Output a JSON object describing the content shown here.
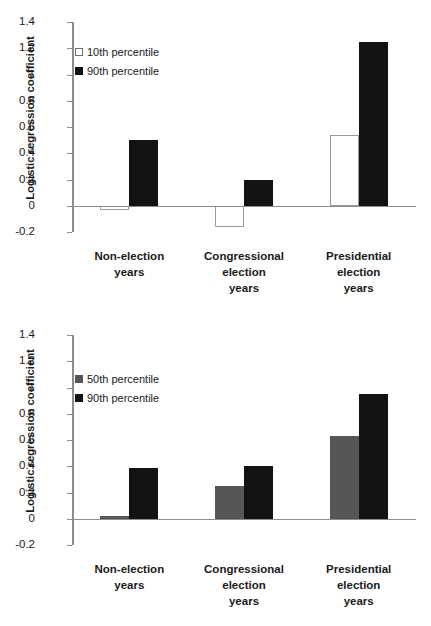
{
  "chart_data": [
    {
      "type": "bar",
      "panel": "top",
      "title": "",
      "xlabel": "",
      "ylabel": "Logistic regression coefficient",
      "ylim": [
        -0.2,
        1.4
      ],
      "yticks": [
        "1.4",
        "1.2",
        "1",
        "0.8",
        "0.6",
        "0.4",
        "0.2",
        "0",
        "-0.2"
      ],
      "ytick_values": [
        1.4,
        1.2,
        1.0,
        0.8,
        0.6,
        0.4,
        0.2,
        0.0,
        -0.2
      ],
      "grid": false,
      "legend_position": "upper left",
      "categories": [
        "Non-election\nyears",
        "Congressional\nelection\nyears",
        "Presidential\nelection\nyears"
      ],
      "series": [
        {
          "name": "10th percentile",
          "color": "#ffffff",
          "values": [
            -0.03,
            -0.165,
            0.54
          ]
        },
        {
          "name": "90th percentile",
          "color": "#121212",
          "values": [
            0.5,
            0.2,
            1.25
          ]
        }
      ]
    },
    {
      "type": "bar",
      "panel": "bottom",
      "title": "",
      "xlabel": "",
      "ylabel": "Logistic regression coefficient",
      "ylim": [
        -0.2,
        1.4
      ],
      "yticks": [
        "1.4",
        "1.2",
        "1",
        "0.8",
        "0.6",
        "0.4",
        "0.2",
        "0",
        "-0.2"
      ],
      "ytick_values": [
        1.4,
        1.2,
        1.0,
        0.8,
        0.6,
        0.4,
        0.2,
        0.0,
        -0.2
      ],
      "grid": false,
      "legend_position": "upper left",
      "categories": [
        "Non-election\nyears",
        "Congressional\nelection\nyears",
        "Presidential\nelection\nyears"
      ],
      "series": [
        {
          "name": "50th percentile",
          "color": "#565656",
          "values": [
            0.02,
            0.25,
            0.63
          ]
        },
        {
          "name": "90th percentile",
          "color": "#121212",
          "values": [
            0.39,
            0.4,
            0.95
          ]
        }
      ]
    }
  ],
  "panels": {
    "top": {
      "ylabel": "Logistic regression coefficient",
      "yticks": [
        "1.4",
        "1.2",
        "1",
        "0.8",
        "0.6",
        "0.4",
        "0.2",
        "0",
        "-0.2"
      ],
      "legend": [
        {
          "label": "10th percentile",
          "swatch": "white"
        },
        {
          "label": "90th percentile",
          "swatch": "black"
        }
      ],
      "categories": [
        "Non-election\nyears",
        "Congressional\nelection\nyears",
        "Presidential\nelection\nyears"
      ]
    },
    "bottom": {
      "ylabel": "Logistic regression coefficient",
      "yticks": [
        "1.4",
        "1.2",
        "1",
        "0.8",
        "0.6",
        "0.4",
        "0.2",
        "0",
        "-0.2"
      ],
      "legend": [
        {
          "label": "50th percentile",
          "swatch": "gray"
        },
        {
          "label": "90th percentile",
          "swatch": "black"
        }
      ],
      "categories": [
        "Non-election\nyears",
        "Congressional\nelection\nyears",
        "Presidential\nelection\nyears"
      ]
    }
  },
  "colors": {
    "black_series": "#121212",
    "gray_series": "#565656",
    "white_series": "#ffffff",
    "axis": "#8c8c8c",
    "text": "#1a1a1a",
    "background": "#ffffff"
  }
}
